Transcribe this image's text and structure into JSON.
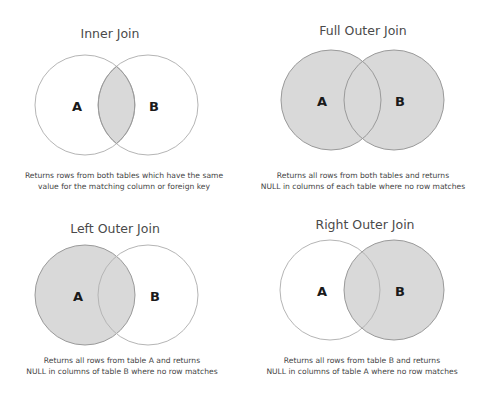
{
  "colors": {
    "background": "#ffffff",
    "fill": "#d9d9d9",
    "stroke": "#b5b5b5",
    "text": "#444444"
  },
  "panels": [
    {
      "id": "inner-join",
      "title": "Inner Join",
      "label_a": "A",
      "label_b": "B",
      "shaded": "intersection",
      "description": [
        "Returns rows from both tables which have the same",
        "value for the matching column or foreign key"
      ]
    },
    {
      "id": "full-outer-join",
      "title": "Full Outer Join",
      "label_a": "A",
      "label_b": "B",
      "shaded": "both",
      "description": [
        "Returns all rows from both tables and returns",
        "NULL in columns of each table where no row matches"
      ]
    },
    {
      "id": "left-outer-join",
      "title": "Left Outer Join",
      "label_a": "A",
      "label_b": "B",
      "shaded": "left",
      "description": [
        "Returns all rows from table A and returns",
        "NULL in columns of table B where no row matches"
      ]
    },
    {
      "id": "right-outer-join",
      "title": "Right Outer Join",
      "label_a": "A",
      "label_b": "B",
      "shaded": "right",
      "description": [
        "Returns all rows from table B and returns",
        "NULL in columns of table A where no row matches"
      ]
    }
  ]
}
